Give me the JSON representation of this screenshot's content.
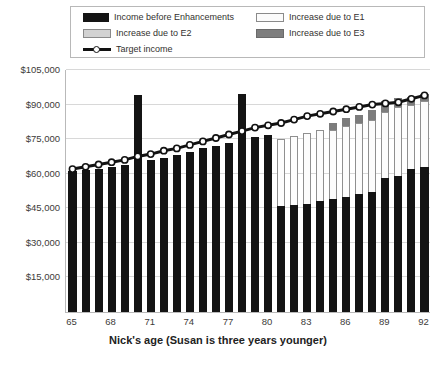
{
  "legend": {
    "items": [
      {
        "label": "Income before Enhancements",
        "swatch": "black-swatch"
      },
      {
        "label": "Increase due to E1",
        "swatch": "e1-swatch"
      },
      {
        "label": "Increase due to E2",
        "swatch": "e2-swatch"
      },
      {
        "label": "Increase due to E3",
        "swatch": "e3-swatch"
      },
      {
        "label": "Target income",
        "swatch": "target-line-swatch"
      }
    ]
  },
  "axes": {
    "y_ticks": [
      "$105,000",
      "$90,000",
      "$75,000",
      "$60,000",
      "$45,000",
      "$30,000",
      "$15,000"
    ],
    "x_ticks": [
      "65",
      "68",
      "71",
      "74",
      "77",
      "80",
      "83",
      "86",
      "89",
      "92"
    ],
    "x_title": "Nick's age (Susan is three years younger)"
  },
  "colors": {
    "base": "#141414",
    "e1": "#fcfcfc",
    "e2": "#d2d2d2",
    "e3": "#7c7c7c",
    "target_line": "#121212",
    "grid": "#d8d8d8"
  },
  "chart_data": {
    "type": "bar",
    "title": "",
    "xlabel": "Nick's age (Susan is three years younger)",
    "ylabel": "",
    "ylim": [
      0,
      105000
    ],
    "ytick_step": 15000,
    "grid": true,
    "legend_position": "top",
    "stacked": true,
    "categories": [
      65,
      66,
      67,
      68,
      69,
      70,
      71,
      72,
      73,
      74,
      75,
      76,
      77,
      78,
      79,
      80,
      81,
      82,
      83,
      84,
      85,
      86,
      87,
      88,
      89,
      90,
      91,
      92
    ],
    "series": [
      {
        "name": "Income before Enhancements",
        "values": [
          61000,
          61500,
          62000,
          63000,
          64000,
          94000,
          66000,
          67000,
          68000,
          69500,
          71000,
          72000,
          73500,
          94500,
          76000,
          77000,
          46000,
          46500,
          47000,
          48000,
          49000,
          50000,
          51000,
          52000,
          58000,
          59000,
          62000,
          63000
        ]
      },
      {
        "name": "Increase due to E1",
        "values": [
          0,
          0,
          0,
          0,
          0,
          0,
          0,
          0,
          0,
          0,
          0,
          0,
          0,
          0,
          0,
          0,
          29000,
          30000,
          30500,
          31000,
          30000,
          30500,
          31000,
          31500,
          29000,
          30000,
          28000,
          28500
        ]
      },
      {
        "name": "Increase due to E2",
        "values": [
          0,
          0,
          0,
          0,
          0,
          0,
          0,
          0,
          0,
          0,
          0,
          0,
          0,
          0,
          0,
          0,
          0,
          0,
          0,
          0,
          0,
          0,
          0,
          0,
          0,
          0,
          0,
          0
        ]
      },
      {
        "name": "Increase due to E3",
        "values": [
          0,
          0,
          0,
          0,
          0,
          0,
          0,
          0,
          0,
          0,
          0,
          0,
          0,
          0,
          0,
          0,
          0,
          0,
          0,
          0,
          3000,
          3500,
          3500,
          4000,
          4500,
          4000,
          3500,
          3000
        ]
      }
    ],
    "target_income": {
      "name": "Target income",
      "values": [
        62000,
        63000,
        64000,
        65000,
        66000,
        67500,
        68500,
        70000,
        71000,
        72500,
        74000,
        75500,
        77000,
        78500,
        80000,
        81000,
        82000,
        83500,
        85000,
        86000,
        87000,
        88000,
        89000,
        90000,
        90500,
        91000,
        92500,
        94000
      ]
    }
  }
}
